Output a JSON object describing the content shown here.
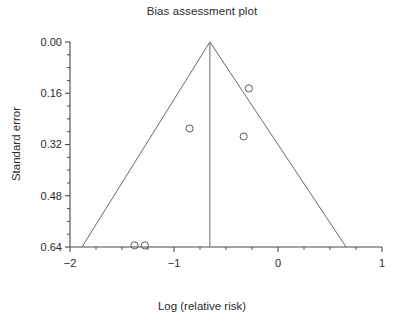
{
  "chart_data": {
    "type": "scatter",
    "title": "Bias assessment plot",
    "xlabel": "Log (relative risk)",
    "ylabel": "Standard error",
    "xlim": [
      -2,
      1
    ],
    "ylim": [
      0.64,
      0.0
    ],
    "y_axis_inverted": true,
    "grid": false,
    "legend": null,
    "x_ticks": [
      -2,
      -1,
      0,
      1
    ],
    "x_tick_labels": [
      "−2",
      "−1",
      "0",
      "1"
    ],
    "x_minor_ticks": [
      -1.75,
      -1.5,
      -1.25,
      -0.75,
      -0.5,
      -0.25,
      0.25,
      0.5,
      0.75
    ],
    "y_ticks": [
      0.0,
      0.16,
      0.32,
      0.48,
      0.64
    ],
    "y_tick_labels": [
      "0.00",
      "0.16",
      "0.32",
      "0.48",
      "0.64"
    ],
    "y_minor_ticks": [
      0.04,
      0.08,
      0.12,
      0.2,
      0.24,
      0.28,
      0.36,
      0.4,
      0.44,
      0.52,
      0.56,
      0.6
    ],
    "points": [
      {
        "x": -0.85,
        "y": 0.27
      },
      {
        "x": -0.28,
        "y": 0.145
      },
      {
        "x": -0.33,
        "y": 0.295
      },
      {
        "x": -1.38,
        "y": 0.635
      },
      {
        "x": -1.28,
        "y": 0.635
      }
    ],
    "marker": {
      "shape": "open-circle",
      "size": 4.6,
      "edge_color": "#5a5a5a",
      "fill": "none"
    },
    "pooled_effect_line": {
      "x": -0.655,
      "y_top": 0.0,
      "y_bottom": 0.64,
      "color": "#6a6a6a"
    },
    "funnel": {
      "apex": {
        "x": -0.655,
        "y": 0.0
      },
      "left_base": {
        "x": -1.885,
        "y": 0.64
      },
      "right_base": {
        "x": 0.655,
        "y": 0.64
      },
      "color": "#6a6a6a"
    },
    "axis_color": "#4a4a4a",
    "text_color": "#2a2a2a"
  },
  "title": "Bias assessment plot",
  "xlabel": "Log (relative risk)",
  "ylabel": "Standard error",
  "y_tick_labels": {
    "t0": "0.00",
    "t1": "0.16",
    "t2": "0.32",
    "t3": "0.48",
    "t4": "0.64"
  },
  "x_tick_labels": {
    "t0": "−2",
    "t1": "−1",
    "t2": "0",
    "t3": "1"
  }
}
